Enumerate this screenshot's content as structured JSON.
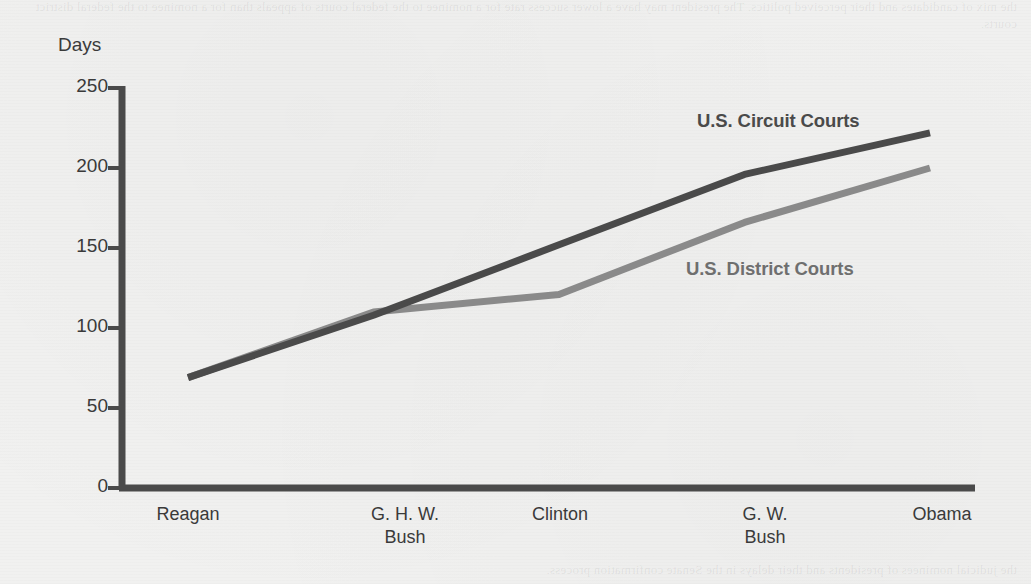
{
  "chart_data": {
    "type": "line",
    "title": "",
    "subtitle": "",
    "xlabel": "",
    "ylabel": "Days",
    "categories": [
      "Reagan",
      "G. H. W.\nBush",
      "Clinton",
      "G. W.\nBush",
      "Obama"
    ],
    "category_lines": [
      [
        "Reagan"
      ],
      [
        "G. H. W.",
        "Bush"
      ],
      [
        "Clinton"
      ],
      [
        "G. W.",
        "Bush"
      ],
      [
        "Obama"
      ]
    ],
    "ylim": [
      0,
      250
    ],
    "yticks": [
      0,
      50,
      100,
      150,
      200,
      250
    ],
    "ytick_labels": [
      "0",
      "50",
      "100",
      "150",
      "200",
      "250"
    ],
    "grid": false,
    "legend_position": "inline-annotations",
    "series": [
      {
        "name": "U.S. Circuit Courts",
        "color": "#4a4a4a",
        "values": [
          69,
          108,
          152,
          196,
          222
        ],
        "label_text": "U.S. Circuit Courts"
      },
      {
        "name": "U.S. District Courts",
        "color": "#8a8a8a",
        "values": [
          69,
          110,
          121,
          166,
          200
        ],
        "label_text": "U.S. District Courts"
      }
    ],
    "annotations": [
      {
        "text": "U.S. Circuit Courts",
        "series": "U.S. Circuit Courts"
      },
      {
        "text": "U.S. District Courts",
        "series": "U.S. District Courts"
      }
    ]
  },
  "axis": {
    "y_title": "Days"
  },
  "colors": {
    "background": "#f1f1f0",
    "axis": "#4a4a4a",
    "circuit": "#4a4a4a",
    "district": "#8a8a8a",
    "text": "#3a3a3a"
  },
  "page_bleed": {
    "top": "the mix of candidates and their perceived politics. The president may have a lower success rate for a nominee to the federal courts of appeals than for a nominee to the federal district courts.",
    "bottom": "the judicial nominees of presidents and their delays in the Senate confirmation process."
  }
}
